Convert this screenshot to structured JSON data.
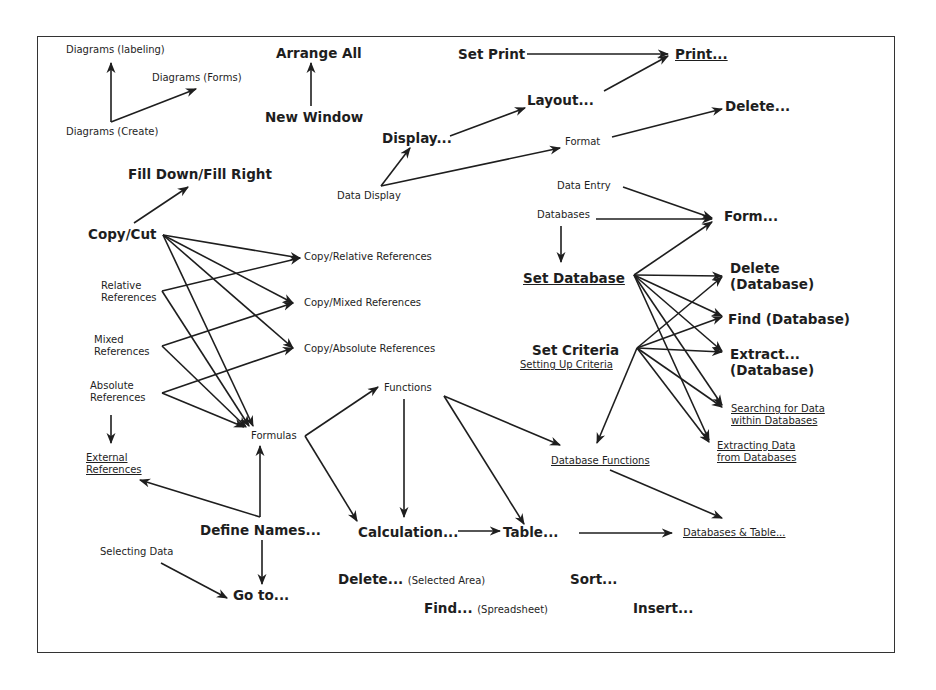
{
  "diagram": {
    "frame": {
      "x": 37,
      "y": 36,
      "w": 858,
      "h": 617
    },
    "nodes": [
      {
        "id": "diagrams-labeling",
        "text": "Diagrams (labeling)",
        "x": 66,
        "y": 44,
        "size": "s",
        "bold": false,
        "ul": false
      },
      {
        "id": "diagrams-forms",
        "text": "Diagrams (Forms)",
        "x": 152,
        "y": 72,
        "size": "s",
        "bold": false,
        "ul": false
      },
      {
        "id": "diagrams-create",
        "text": "Diagrams (Create)",
        "x": 66,
        "y": 126,
        "size": "s",
        "bold": false,
        "ul": false
      },
      {
        "id": "arrange-all",
        "text": "Arrange All",
        "x": 276,
        "y": 45,
        "size": "l",
        "bold": true,
        "ul": false
      },
      {
        "id": "new-window",
        "text": "New Window",
        "x": 265,
        "y": 109,
        "size": "l",
        "bold": true,
        "ul": false
      },
      {
        "id": "set-print",
        "text": "Set Print",
        "x": 458,
        "y": 46,
        "size": "l",
        "bold": true,
        "ul": false
      },
      {
        "id": "print",
        "text": "Print...",
        "x": 675,
        "y": 46,
        "size": "l",
        "bold": true,
        "ul": true
      },
      {
        "id": "layout",
        "text": "Layout...",
        "x": 527,
        "y": 92,
        "size": "l",
        "bold": true,
        "ul": false
      },
      {
        "id": "delete-format",
        "text": "Delete...",
        "x": 725,
        "y": 98,
        "size": "l",
        "bold": true,
        "ul": false
      },
      {
        "id": "display",
        "text": "Display...",
        "x": 382,
        "y": 130,
        "size": "l",
        "bold": true,
        "ul": false
      },
      {
        "id": "format",
        "text": "Format",
        "x": 565,
        "y": 136,
        "size": "s",
        "bold": false,
        "ul": false
      },
      {
        "id": "data-display",
        "text": "Data Display",
        "x": 337,
        "y": 190,
        "size": "s",
        "bold": false,
        "ul": false
      },
      {
        "id": "fill-down",
        "text": "Fill Down/Fill Right",
        "x": 128,
        "y": 166,
        "size": "l",
        "bold": true,
        "ul": false
      },
      {
        "id": "data-entry",
        "text": "Data Entry",
        "x": 557,
        "y": 180,
        "size": "s",
        "bold": false,
        "ul": false
      },
      {
        "id": "databases",
        "text": "Databases",
        "x": 537,
        "y": 209,
        "size": "s",
        "bold": false,
        "ul": false
      },
      {
        "id": "form",
        "text": "Form...",
        "x": 724,
        "y": 208,
        "size": "l",
        "bold": true,
        "ul": false
      },
      {
        "id": "copy-cut",
        "text": "Copy/Cut",
        "x": 88,
        "y": 226,
        "size": "l",
        "bold": true,
        "ul": false
      },
      {
        "id": "copy-relative",
        "text": "Copy/Relative References",
        "x": 304,
        "y": 251,
        "size": "s",
        "bold": false,
        "ul": false
      },
      {
        "id": "relative-refs",
        "text": "Relative\nReferences",
        "x": 101,
        "y": 280,
        "size": "s",
        "bold": false,
        "ul": false
      },
      {
        "id": "set-database",
        "text": "Set Database",
        "x": 523,
        "y": 270,
        "size": "l",
        "bold": true,
        "ul": true
      },
      {
        "id": "delete-db",
        "text": "Delete\n(Database)",
        "x": 730,
        "y": 260,
        "size": "l",
        "bold": true,
        "ul": false
      },
      {
        "id": "copy-mixed",
        "text": "Copy/Mixed References",
        "x": 304,
        "y": 297,
        "size": "s",
        "bold": false,
        "ul": false
      },
      {
        "id": "find-db",
        "text": "Find (Database)",
        "x": 728,
        "y": 311,
        "size": "l",
        "bold": true,
        "ul": false
      },
      {
        "id": "mixed-refs",
        "text": "Mixed\nReferences",
        "x": 94,
        "y": 334,
        "size": "s",
        "bold": false,
        "ul": false
      },
      {
        "id": "copy-absolute",
        "text": "Copy/Absolute References",
        "x": 304,
        "y": 343,
        "size": "s",
        "bold": false,
        "ul": false
      },
      {
        "id": "set-criteria",
        "text": "Set Criteria",
        "x": 532,
        "y": 342,
        "size": "l",
        "bold": true,
        "ul": false
      },
      {
        "id": "setting-up-criteria",
        "text": "Setting Up Criteria",
        "x": 520,
        "y": 359,
        "size": "s",
        "bold": false,
        "ul": true
      },
      {
        "id": "extract-db",
        "text": "Extract...\n(Database)",
        "x": 730,
        "y": 346,
        "size": "l",
        "bold": true,
        "ul": false
      },
      {
        "id": "functions",
        "text": "Functions",
        "x": 384,
        "y": 382,
        "size": "s",
        "bold": false,
        "ul": false
      },
      {
        "id": "absolute-refs",
        "text": "Absolute\nReferences",
        "x": 90,
        "y": 380,
        "size": "s",
        "bold": false,
        "ul": false
      },
      {
        "id": "searching-data",
        "text": "Searching for Data\nwithin Databases",
        "x": 731,
        "y": 403,
        "size": "s",
        "bold": false,
        "ul": true
      },
      {
        "id": "formulas",
        "text": "Formulas",
        "x": 251,
        "y": 430,
        "size": "s",
        "bold": false,
        "ul": false
      },
      {
        "id": "extracting-data",
        "text": "Extracting Data\nfrom Databases",
        "x": 717,
        "y": 440,
        "size": "s",
        "bold": false,
        "ul": true
      },
      {
        "id": "external-refs",
        "text": "External\nReferences",
        "x": 86,
        "y": 452,
        "size": "s",
        "bold": false,
        "ul": true
      },
      {
        "id": "database-functions",
        "text": "Database Functions",
        "x": 551,
        "y": 455,
        "size": "s",
        "bold": false,
        "ul": true
      },
      {
        "id": "define-names",
        "text": "Define Names...",
        "x": 200,
        "y": 522,
        "size": "l",
        "bold": true,
        "ul": false
      },
      {
        "id": "calculation",
        "text": "Calculation...",
        "x": 358,
        "y": 524,
        "size": "l",
        "bold": true,
        "ul": false
      },
      {
        "id": "table",
        "text": "Table...",
        "x": 503,
        "y": 524,
        "size": "l",
        "bold": true,
        "ul": false
      },
      {
        "id": "databases-table",
        "text": "Databases & Table...",
        "x": 683,
        "y": 527,
        "size": "s",
        "bold": false,
        "ul": true
      },
      {
        "id": "selecting-data",
        "text": "Selecting Data",
        "x": 100,
        "y": 546,
        "size": "s",
        "bold": false,
        "ul": false
      },
      {
        "id": "go-to",
        "text": "Go to...",
        "x": 233,
        "y": 587,
        "size": "l",
        "bold": true,
        "ul": false
      },
      {
        "id": "delete-selected",
        "text": "Delete...",
        "sub": "(Selected Area)",
        "x": 338,
        "y": 571,
        "size": "l",
        "bold": true,
        "ul": false
      },
      {
        "id": "sort",
        "text": "Sort...",
        "x": 570,
        "y": 571,
        "size": "l",
        "bold": true,
        "ul": false
      },
      {
        "id": "find-spreadsheet",
        "text": "Find...",
        "sub": "(Spreadsheet)",
        "x": 424,
        "y": 600,
        "size": "l",
        "bold": true,
        "ul": false
      },
      {
        "id": "insert",
        "text": "Insert...",
        "x": 633,
        "y": 600,
        "size": "l",
        "bold": true,
        "ul": false
      }
    ],
    "arrows": [
      {
        "from": "diagrams-create",
        "to": "diagrams-labeling",
        "pts": [
          [
            111,
            122
          ],
          [
            111,
            63
          ]
        ]
      },
      {
        "from": "diagrams-create",
        "to": "diagrams-forms",
        "pts": [
          [
            111,
            122
          ],
          [
            196,
            89
          ]
        ]
      },
      {
        "from": "new-window",
        "to": "arrange-all",
        "pts": [
          [
            311,
            106
          ],
          [
            311,
            63
          ]
        ]
      },
      {
        "from": "set-print",
        "to": "print",
        "pts": [
          [
            527,
            54
          ],
          [
            668,
            54
          ]
        ]
      },
      {
        "from": "layout",
        "to": "print",
        "pts": [
          [
            604,
            91
          ],
          [
            668,
            56
          ]
        ]
      },
      {
        "from": "display",
        "to": "layout",
        "pts": [
          [
            450,
            136
          ],
          [
            525,
            108
          ]
        ]
      },
      {
        "from": "data-display",
        "to": "display",
        "pts": [
          [
            381,
            186
          ],
          [
            410,
            148
          ]
        ]
      },
      {
        "from": "data-display",
        "to": "format",
        "pts": [
          [
            381,
            186
          ],
          [
            560,
            148
          ]
        ]
      },
      {
        "from": "format",
        "to": "delete-format",
        "pts": [
          [
            612,
            137
          ],
          [
            722,
            109
          ]
        ]
      },
      {
        "from": "copy-cut",
        "to": "fill-down",
        "pts": [
          [
            134,
            223
          ],
          [
            188,
            187
          ]
        ]
      },
      {
        "from": "copy-cut",
        "to": "copy-relative",
        "pts": [
          [
            163,
            235
          ],
          [
            300,
            258
          ]
        ]
      },
      {
        "from": "copy-cut",
        "to": "copy-mixed",
        "pts": [
          [
            163,
            235
          ],
          [
            293,
            303
          ]
        ]
      },
      {
        "from": "copy-cut",
        "to": "copy-absolute",
        "pts": [
          [
            163,
            235
          ],
          [
            293,
            348
          ]
        ]
      },
      {
        "from": "copy-cut",
        "to": "formulas",
        "pts": [
          [
            163,
            235
          ],
          [
            253,
            426
          ]
        ]
      },
      {
        "from": "relative-refs",
        "to": "copy-relative",
        "pts": [
          [
            162,
            291
          ],
          [
            300,
            258
          ]
        ]
      },
      {
        "from": "relative-refs",
        "to": "formulas",
        "pts": [
          [
            162,
            291
          ],
          [
            249,
            426
          ]
        ]
      },
      {
        "from": "mixed-refs",
        "to": "copy-mixed",
        "pts": [
          [
            162,
            346
          ],
          [
            293,
            303
          ]
        ]
      },
      {
        "from": "mixed-refs",
        "to": "formulas",
        "pts": [
          [
            162,
            346
          ],
          [
            246,
            427
          ]
        ]
      },
      {
        "from": "absolute-refs",
        "to": "copy-absolute",
        "pts": [
          [
            162,
            393
          ],
          [
            293,
            348
          ]
        ]
      },
      {
        "from": "absolute-refs",
        "to": "formulas",
        "pts": [
          [
            162,
            393
          ],
          [
            244,
            427
          ]
        ]
      },
      {
        "from": "absolute-refs",
        "to": "external-refs",
        "pts": [
          [
            111,
            415
          ],
          [
            111,
            443
          ]
        ]
      },
      {
        "from": "formulas",
        "to": "functions",
        "pts": [
          [
            305,
            436
          ],
          [
            378,
            387
          ]
        ]
      },
      {
        "from": "formulas",
        "to": "calculation",
        "pts": [
          [
            305,
            436
          ],
          [
            357,
            521
          ]
        ]
      },
      {
        "from": "define-names",
        "to": "formulas",
        "pts": [
          [
            260,
            517
          ],
          [
            260,
            446
          ]
        ]
      },
      {
        "from": "define-names",
        "to": "external-refs",
        "pts": [
          [
            260,
            517
          ],
          [
            140,
            480
          ]
        ]
      },
      {
        "from": "define-names",
        "to": "go-to",
        "pts": [
          [
            262,
            540
          ],
          [
            262,
            584
          ]
        ]
      },
      {
        "from": "selecting-data",
        "to": "go-to",
        "pts": [
          [
            161,
            563
          ],
          [
            227,
            598
          ]
        ]
      },
      {
        "from": "functions",
        "to": "calculation",
        "pts": [
          [
            404,
            399
          ],
          [
            404,
            517
          ]
        ]
      },
      {
        "from": "functions",
        "to": "table",
        "pts": [
          [
            444,
            396
          ],
          [
            524,
            524
          ]
        ]
      },
      {
        "from": "functions",
        "to": "database-functions",
        "pts": [
          [
            444,
            396
          ],
          [
            560,
            445
          ]
        ]
      },
      {
        "from": "calculation",
        "to": "table",
        "pts": [
          [
            458,
            531
          ],
          [
            500,
            531
          ]
        ]
      },
      {
        "from": "table",
        "to": "databases-table",
        "pts": [
          [
            579,
            533
          ],
          [
            672,
            533
          ]
        ]
      },
      {
        "from": "database-functions",
        "to": "databases-table",
        "pts": [
          [
            610,
            470
          ],
          [
            722,
            518
          ]
        ]
      },
      {
        "from": "data-entry",
        "to": "form",
        "pts": [
          [
            623,
            187
          ],
          [
            712,
            218
          ]
        ]
      },
      {
        "from": "databases",
        "to": "form",
        "pts": [
          [
            596,
            219
          ],
          [
            712,
            219
          ]
        ]
      },
      {
        "from": "databases",
        "to": "set-database",
        "pts": [
          [
            561,
            226
          ],
          [
            561,
            262
          ]
        ]
      },
      {
        "from": "set-database",
        "to": "form",
        "pts": [
          [
            634,
            275
          ],
          [
            712,
            222
          ]
        ]
      },
      {
        "from": "set-database",
        "to": "delete-db",
        "pts": [
          [
            634,
            275
          ],
          [
            722,
            276
          ]
        ]
      },
      {
        "from": "set-database",
        "to": "find-db",
        "pts": [
          [
            634,
            275
          ],
          [
            722,
            316
          ]
        ]
      },
      {
        "from": "set-database",
        "to": "extract-db",
        "pts": [
          [
            634,
            275
          ],
          [
            722,
            351
          ]
        ]
      },
      {
        "from": "set-database",
        "to": "searching-data",
        "pts": [
          [
            634,
            275
          ],
          [
            722,
            405
          ]
        ]
      },
      {
        "from": "set-database",
        "to": "extracting-data",
        "pts": [
          [
            634,
            275
          ],
          [
            709,
            440
          ]
        ]
      },
      {
        "from": "set-criteria",
        "to": "delete-db",
        "pts": [
          [
            637,
            348
          ],
          [
            722,
            277
          ]
        ]
      },
      {
        "from": "set-criteria",
        "to": "find-db",
        "pts": [
          [
            637,
            348
          ],
          [
            722,
            317
          ]
        ]
      },
      {
        "from": "set-criteria",
        "to": "extract-db",
        "pts": [
          [
            637,
            348
          ],
          [
            722,
            352
          ]
        ]
      },
      {
        "from": "set-criteria",
        "to": "searching-data",
        "pts": [
          [
            637,
            348
          ],
          [
            722,
            407
          ]
        ]
      },
      {
        "from": "set-criteria",
        "to": "extracting-data",
        "pts": [
          [
            637,
            348
          ],
          [
            709,
            442
          ]
        ]
      },
      {
        "from": "set-criteria",
        "to": "database-functions",
        "pts": [
          [
            637,
            348
          ],
          [
            597,
            443
          ]
        ]
      }
    ]
  },
  "colors": {
    "ink": "#1e1e1e",
    "frame": "#333333",
    "background": "#ffffff"
  }
}
